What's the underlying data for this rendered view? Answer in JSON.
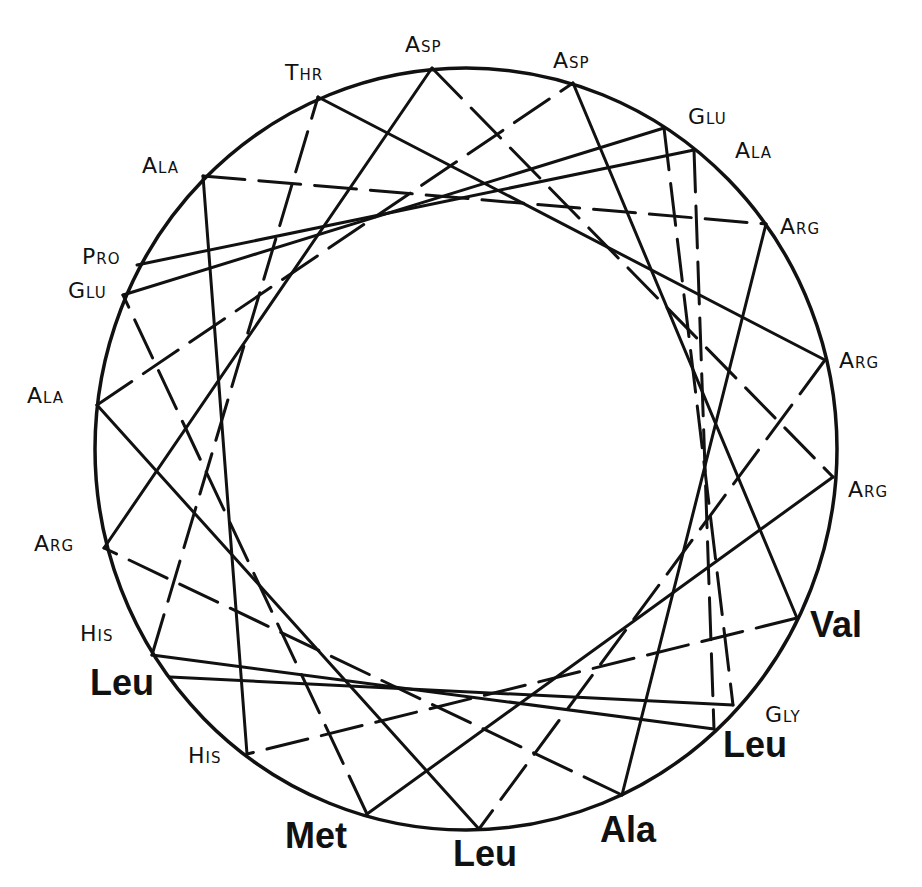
{
  "diagram": {
    "type": "helical-wheel",
    "outer_circle": {
      "cx": 466,
      "cy": 449,
      "rx": 371,
      "ry": 381
    },
    "line_color": "#111111",
    "sequence_order": [
      7,
      4,
      17,
      14,
      2,
      9,
      21,
      10,
      1,
      13,
      18,
      5,
      6,
      20,
      12,
      0,
      11,
      19,
      8,
      3,
      16,
      15
    ],
    "residues": [
      {
        "id": 0,
        "label": "Asp",
        "style": "thin",
        "x": 432,
        "y": 68,
        "lx": 405,
        "ly": 34
      },
      {
        "id": 1,
        "label": "Asp",
        "style": "thin",
        "x": 573,
        "y": 83,
        "lx": 553,
        "ly": 50
      },
      {
        "id": 2,
        "label": "Thr",
        "style": "thin",
        "x": 318,
        "y": 97,
        "lx": 285,
        "ly": 62
      },
      {
        "id": 3,
        "label": "Glu",
        "style": "thin",
        "x": 664,
        "y": 128,
        "lx": 688,
        "ly": 106
      },
      {
        "id": 4,
        "label": "Ala",
        "style": "thin",
        "x": 694,
        "y": 150,
        "lx": 735,
        "ly": 140
      },
      {
        "id": 5,
        "label": "Ala",
        "style": "thin",
        "x": 203,
        "y": 176,
        "lx": 142,
        "ly": 155
      },
      {
        "id": 6,
        "label": "Arg",
        "style": "thin",
        "x": 766,
        "y": 224,
        "lx": 780,
        "ly": 216
      },
      {
        "id": 7,
        "label": "Pro",
        "style": "thin",
        "x": 137,
        "y": 265,
        "lx": 82,
        "ly": 246
      },
      {
        "id": 8,
        "label": "Glu",
        "style": "thin",
        "x": 123,
        "y": 295,
        "lx": 68,
        "ly": 280
      },
      {
        "id": 9,
        "label": "Arg",
        "style": "thin",
        "x": 825,
        "y": 360,
        "lx": 839,
        "ly": 350
      },
      {
        "id": 10,
        "label": "Ala",
        "style": "thin",
        "x": 97,
        "y": 405,
        "lx": 27,
        "ly": 385
      },
      {
        "id": 11,
        "label": "Arg",
        "style": "thin",
        "x": 833,
        "y": 477,
        "lx": 848,
        "ly": 479
      },
      {
        "id": 12,
        "label": "Arg",
        "style": "thin",
        "x": 104,
        "y": 548,
        "lx": 34,
        "ly": 533
      },
      {
        "id": 13,
        "label": "Val",
        "style": "bold",
        "x": 797,
        "y": 618,
        "lx": 810,
        "ly": 607
      },
      {
        "id": 14,
        "label": "His",
        "style": "thin",
        "x": 152,
        "y": 655,
        "lx": 80,
        "ly": 623
      },
      {
        "id": 15,
        "label": "Leu",
        "style": "bold",
        "x": 170,
        "y": 677,
        "lx": 90,
        "ly": 665
      },
      {
        "id": 16,
        "label": "Gly",
        "style": "thin",
        "x": 733,
        "y": 705,
        "lx": 765,
        "ly": 704
      },
      {
        "id": 17,
        "label": "Leu",
        "style": "bold",
        "x": 714,
        "y": 729,
        "lx": 723,
        "ly": 727
      },
      {
        "id": 18,
        "label": "His",
        "style": "thin",
        "x": 247,
        "y": 754,
        "lx": 188,
        "ly": 745
      },
      {
        "id": 19,
        "label": "Met",
        "style": "bold",
        "x": 367,
        "y": 814,
        "lx": 285,
        "ly": 818
      },
      {
        "id": 20,
        "label": "Ala",
        "style": "bold",
        "x": 622,
        "y": 795,
        "lx": 600,
        "ly": 812
      },
      {
        "id": 21,
        "label": "Leu",
        "style": "bold",
        "x": 479,
        "y": 829,
        "lx": 453,
        "ly": 836
      }
    ]
  }
}
